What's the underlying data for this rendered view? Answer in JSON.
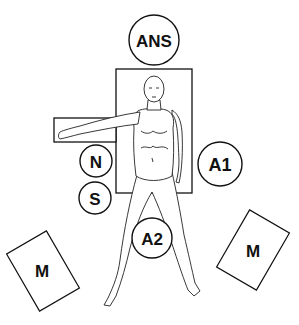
{
  "diagram": {
    "type": "operating-room-layout",
    "stations": [
      {
        "id": "ans",
        "label": "ANS",
        "shape": "circle",
        "cx": 154,
        "cy": 40,
        "r": 25
      },
      {
        "id": "n",
        "label": "N",
        "shape": "circle",
        "cx": 96,
        "cy": 161,
        "r": 16
      },
      {
        "id": "s",
        "label": "S",
        "shape": "circle",
        "cx": 95,
        "cy": 198,
        "r": 16
      },
      {
        "id": "a1",
        "label": "A1",
        "shape": "circle",
        "cx": 220,
        "cy": 164,
        "r": 22
      },
      {
        "id": "a2",
        "label": "A2",
        "shape": "circle",
        "cx": 152,
        "cy": 238,
        "r": 20
      },
      {
        "id": "m-left",
        "label": "M",
        "shape": "rect",
        "cx": 43,
        "cy": 271,
        "w": 46,
        "h": 66,
        "rotate": -30
      },
      {
        "id": "m-right",
        "label": "M",
        "shape": "rect",
        "cx": 253,
        "cy": 250,
        "w": 46,
        "h": 66,
        "rotate": 30
      }
    ],
    "table": {
      "x": 116,
      "y": 69,
      "w": 76,
      "h": 124
    },
    "arm_board": {
      "x": 54,
      "y": 118,
      "w": 62,
      "h": 24
    }
  }
}
